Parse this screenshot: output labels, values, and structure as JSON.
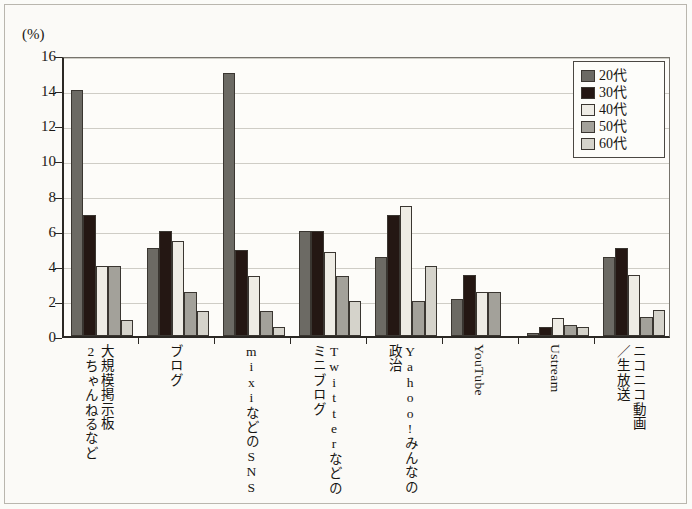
{
  "figure": {
    "unit_label": "(%)"
  },
  "chart_data": {
    "type": "bar",
    "title": "",
    "subtitle": "",
    "xlabel": "",
    "ylabel": "(%)",
    "ylim": [
      0,
      16
    ],
    "ytick_values": [
      0,
      2,
      4,
      6,
      8,
      10,
      12,
      14,
      16
    ],
    "ytick_labels": [
      "0",
      "2",
      "4",
      "6",
      "8",
      "10",
      "12",
      "14",
      "16"
    ],
    "grid": true,
    "legend_position": "top-right",
    "categories": [
      "大規模掲示板 2ちゃんねるなど",
      "ブログ",
      "mixiなどのSNS",
      "Twitterなどの ミニブログ",
      "Yahoo!みんなの 政治",
      "YouTube",
      "Ustream",
      "ニコニコ動画 ／生放送"
    ],
    "category_lines": [
      [
        "大規模掲示板",
        "2ちゃんねるなど"
      ],
      [
        "ブログ"
      ],
      [
        "mixiなどのSNS"
      ],
      [
        "Twitterなどの",
        "ミニブログ"
      ],
      [
        "Yahoo!みんなの",
        "政治"
      ],
      [
        "YouTube"
      ],
      [
        "Ustream"
      ],
      [
        "ニコニコ動画",
        "／生放送"
      ]
    ],
    "series": [
      {
        "name": "20代",
        "color": "#6c6a64",
        "values": [
          14.0,
          5.0,
          15.0,
          6.0,
          4.5,
          2.1,
          0.2,
          4.5
        ]
      },
      {
        "name": "30代",
        "color": "#241713",
        "values": [
          6.9,
          6.0,
          4.9,
          6.0,
          6.9,
          3.5,
          0.5,
          5.0
        ]
      },
      {
        "name": "40代",
        "color": "#eeece5",
        "values": [
          4.0,
          5.4,
          3.4,
          4.8,
          7.4,
          2.5,
          1.0,
          3.5
        ]
      },
      {
        "name": "50代",
        "color": "#a3a19a",
        "values": [
          4.0,
          2.5,
          1.4,
          3.4,
          2.0,
          2.5,
          0.6,
          1.1
        ]
      },
      {
        "name": "60代",
        "color": "#d5d3cb",
        "values": [
          0.9,
          1.4,
          0.5,
          2.0,
          4.0,
          0.0,
          0.5,
          1.5
        ]
      }
    ]
  },
  "legend": {
    "items": [
      {
        "label": "20代",
        "color": "#6c6a64"
      },
      {
        "label": "30代",
        "color": "#241713"
      },
      {
        "label": "40代",
        "color": "#eeece5"
      },
      {
        "label": "50代",
        "color": "#a3a19a"
      },
      {
        "label": "60代",
        "color": "#d5d3cb"
      }
    ]
  }
}
